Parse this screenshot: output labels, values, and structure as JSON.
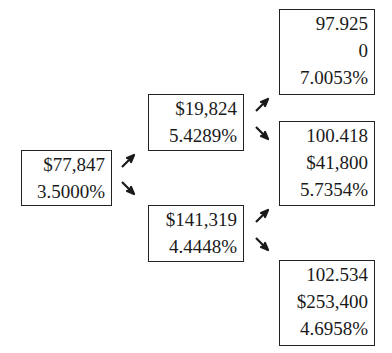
{
  "tree": {
    "root": {
      "lines": [
        "$77,847",
        "3.5000%"
      ]
    },
    "level1": {
      "up": {
        "lines": [
          "$19,824",
          "5.4289%"
        ]
      },
      "down": {
        "lines": [
          "$141,319",
          "4.4448%"
        ]
      }
    },
    "level2": {
      "uu": {
        "lines": [
          "97.925",
          "0",
          "7.0053%"
        ]
      },
      "ud": {
        "lines": [
          "100.418",
          "$41,800",
          "5.7354%"
        ]
      },
      "dd": {
        "lines": [
          "102.534",
          "$253,400",
          "4.6958%"
        ]
      }
    },
    "arrows": {
      "up_icon": "arrow-up-right-icon",
      "down_icon": "arrow-down-right-icon",
      "color": "#1a1a1a"
    }
  }
}
